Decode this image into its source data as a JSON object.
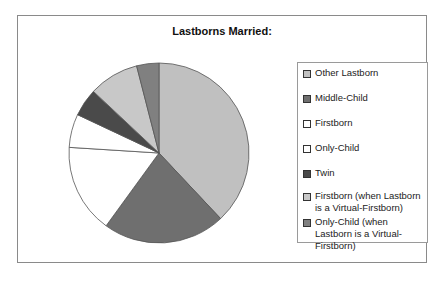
{
  "chart_data": {
    "type": "pie",
    "title": "Lastborns Married:",
    "start_angle": "12 o'clock, clockwise",
    "legend_position": "right",
    "slices": [
      {
        "label": "Other Lastborn",
        "value": 38,
        "color": "#c0c0c0"
      },
      {
        "label": "Middle-Child",
        "value": 22,
        "color": "#6f6f6f"
      },
      {
        "label": "Firstborn",
        "value": 16,
        "color": "#ffffff"
      },
      {
        "label": "Only-Child",
        "value": 6,
        "color": "#ffffff"
      },
      {
        "label": "Twin",
        "value": 5,
        "color": "#4a4a4a"
      },
      {
        "label": "Firstborn (when Lastborn is a Virtual-Firstborn)",
        "value": 9,
        "color": "#c8c8c8"
      },
      {
        "label": "Only-Child (when Lastborn is a Virtual-Firstborn)",
        "value": 4,
        "color": "#808080"
      }
    ],
    "units": "percent (estimated from slice angles)"
  },
  "legend": {
    "items": [
      {
        "label": "Other Lastborn"
      },
      {
        "label": "Middle-Child"
      },
      {
        "label": "Firstborn"
      },
      {
        "label": "Only-Child"
      },
      {
        "label": "Twin"
      },
      {
        "label": "Firstborn (when Lastborn is a Virtual-Firstborn)"
      },
      {
        "label": "Only-Child (when Lastborn is a Virtual-Firstborn)"
      }
    ]
  }
}
